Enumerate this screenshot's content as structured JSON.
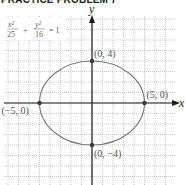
{
  "header": {
    "title": "PRACTICE PROBLEM 7"
  },
  "chart_data": {
    "type": "line",
    "title": "PRACTICE PROBLEM 7",
    "equation": {
      "x_num": "x²",
      "x_den": "25",
      "plus": "+",
      "y_num": "y²",
      "y_den": "16",
      "rhs": "= 1"
    },
    "curve": {
      "kind": "ellipse",
      "a": 5,
      "b": 4,
      "center": [
        0,
        0
      ]
    },
    "xlabel": "x",
    "ylabel": "y",
    "xlim": [
      -8.5,
      7.9
    ],
    "ylim": [
      -7.8,
      8.4
    ],
    "grid": true,
    "points": [
      {
        "x": 0,
        "y": 4,
        "label": "(0, 4)"
      },
      {
        "x": 5,
        "y": 0,
        "label": "(5, 0)"
      },
      {
        "x": -5,
        "y": 0,
        "label": "(−5, 0)"
      },
      {
        "x": 0,
        "y": -4,
        "label": "(0, −4)"
      }
    ]
  }
}
